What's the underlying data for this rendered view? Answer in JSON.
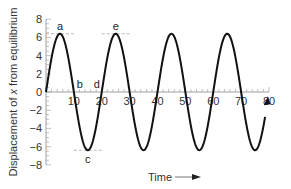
{
  "chart_data": {
    "type": "line",
    "title": "",
    "xlabel": "Time",
    "ylabel": "Displacement of x from equilibrium",
    "xlim": [
      0,
      80
    ],
    "ylim": [
      -8,
      8
    ],
    "x_ticks": [
      10,
      20,
      30,
      40,
      50,
      60,
      70,
      80
    ],
    "y_ticks": [
      8,
      6,
      4,
      2,
      0,
      -2,
      -4,
      -6,
      -8
    ],
    "grid": false,
    "legend": null,
    "series": [
      {
        "name": "displacement",
        "function": "6.4*sin(2*pi*t/20)",
        "amplitude": 6.4,
        "period": 20,
        "x": [
          0,
          5,
          10,
          15,
          20,
          25,
          30,
          35,
          40,
          45,
          50,
          55,
          60,
          65,
          70,
          75,
          80
        ],
        "values": [
          0,
          6.4,
          0,
          -6.4,
          0,
          6.4,
          0,
          -6.4,
          0,
          6.4,
          0,
          -6.4,
          0,
          6.4,
          0,
          -6.4,
          0
        ]
      }
    ],
    "annotations": [
      {
        "label": "a",
        "x": 5,
        "y": 6.4
      },
      {
        "label": "b",
        "x": 10,
        "y": 0
      },
      {
        "label": "c",
        "x": 15,
        "y": -6.4
      },
      {
        "label": "d",
        "x": 20,
        "y": 0
      },
      {
        "label": "e",
        "x": 25,
        "y": 6.4
      }
    ],
    "reference_lines": [
      {
        "y": 6.4,
        "x_from": 0,
        "x_to": 10,
        "style": "dashed"
      },
      {
        "y": 6.4,
        "x_from": 20,
        "x_to": 30,
        "style": "dashed"
      },
      {
        "y": -6.4,
        "x_from": 10,
        "x_to": 20,
        "style": "dashed"
      }
    ]
  },
  "labels": {
    "ylabel": "Displacement of x from equilibrium",
    "ylabel_pre": "Displacement of ",
    "ylabel_var": "x",
    "ylabel_post": " from equilibrium",
    "xlabel": "Time"
  }
}
